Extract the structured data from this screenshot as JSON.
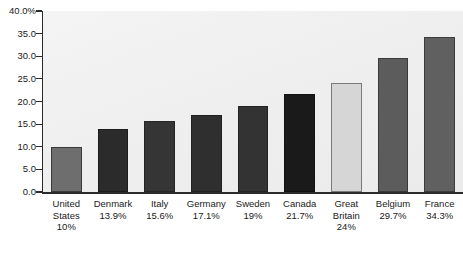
{
  "chart_data": {
    "type": "bar",
    "title": "",
    "subtitle": "",
    "xlabel": "",
    "ylabel": "",
    "ylim": [
      0,
      40
    ],
    "grid": false,
    "legend": "none",
    "y_ticks": [
      "0.0",
      "5.0",
      "10.0",
      "15.0",
      "20.0",
      "25.0",
      "30.0",
      "35.0",
      "40.0%"
    ],
    "y_tick_values": [
      0,
      5,
      10,
      15,
      20,
      25,
      30,
      35,
      40
    ],
    "categories": [
      "United States",
      "Denmark",
      "Italy",
      "Germany",
      "Sweden",
      "Canada",
      "Great Britain",
      "Belgium",
      "France"
    ],
    "value_labels": [
      "10%",
      "13.9%",
      "15.6%",
      "17.1%",
      "19%",
      "21.7%",
      "24%",
      "29.7%",
      "34.3%"
    ],
    "values": [
      10,
      13.9,
      15.6,
      17.1,
      19,
      21.7,
      24,
      29.7,
      34.3
    ],
    "bar_colors": [
      "#6e6e6e",
      "#2b2b2b",
      "#353535",
      "#2f2f2f",
      "#333333",
      "#1a1a1a",
      "#d6d6d6",
      "#5c5c5c",
      "#606060"
    ],
    "bar_border_colors": [
      "#3a3a3a",
      "#1c1c1c",
      "#242424",
      "#202020",
      "#232323",
      "#111111",
      "#7a7a7a",
      "#3a3a3a",
      "#3c3c3c"
    ],
    "plot_background": "#efefef",
    "axis_color": "#2b2b2b",
    "text_color": "#1a1a1a"
  }
}
